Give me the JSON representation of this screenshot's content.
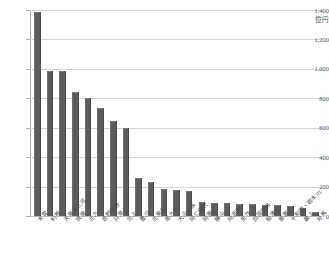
{
  "chart_data": {
    "type": "bar",
    "title": "",
    "subtitle": "",
    "xlabel": "",
    "ylabel": "億円",
    "unit": "億円",
    "ylim": [
      0,
      1400
    ],
    "ytick_step": 200,
    "yticks": [
      0,
      200,
      400,
      600,
      800,
      1000,
      1200,
      1400
    ],
    "ytick_labels": [
      "0",
      "200",
      "400",
      "600",
      "800",
      "1,000",
      "1,200",
      "1,400"
    ],
    "grid": true,
    "legend": "none",
    "bar_color": "#5c5c5c",
    "gridline_color": "#d6d6d6",
    "axis_color": "#b0b0b0",
    "categories": [
      "木曽",
      "利根",
      "天竜東三河",
      "筑後",
      "北九州",
      "吉野熊野",
      "只見",
      "北上",
      "豊川",
      "北東北",
      "南九州",
      "大山山系",
      "阿仁田沢",
      "阿賀",
      "勝山",
      "阿武隈",
      "矢作",
      "四国四県",
      "船津川",
      "那賀",
      "十和田・岩木川",
      "最上",
      "対馬"
    ],
    "values": [
      1395,
      995,
      990,
      848,
      812,
      742,
      655,
      605,
      262,
      235,
      188,
      182,
      178,
      100,
      95,
      92,
      90,
      88,
      85,
      82,
      78,
      60,
      32
    ]
  }
}
